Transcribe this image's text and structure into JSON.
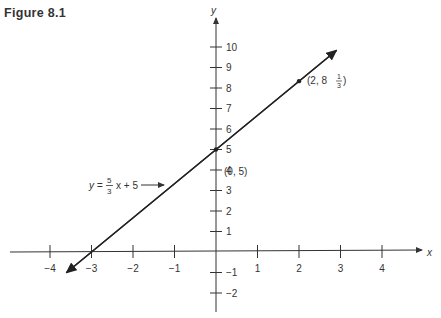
{
  "figure": {
    "title": "Figure 8.1"
  },
  "chart_data": {
    "type": "line",
    "title": "Figure 8.1",
    "xlabel": "x",
    "ylabel": "y",
    "xlim": [
      -4.5,
      4.5
    ],
    "ylim": [
      -2.5,
      10.5
    ],
    "grid": false,
    "x_ticks": [
      -4,
      -3,
      -2,
      -1,
      1,
      2,
      3,
      4
    ],
    "x_tick_labels": [
      "−4",
      "−3",
      "−2",
      "−1",
      "1",
      "2",
      "3",
      "4"
    ],
    "y_ticks": [
      -2,
      -1,
      1,
      2,
      3,
      4,
      5,
      6,
      7,
      8,
      9,
      10
    ],
    "y_tick_labels": [
      "−2",
      "−1",
      "1",
      "2",
      "3",
      "4",
      "5",
      "6",
      "7",
      "8",
      "9",
      "10"
    ],
    "series": [
      {
        "name": "y = 5/3 x + 5",
        "equation": "y = (5/3)x + 5",
        "slope": 1.6667,
        "intercept": 5,
        "x": [
          -3.6,
          -3,
          0,
          2,
          2.9
        ],
        "y": [
          -1.0,
          0,
          5,
          8.3333,
          9.8333
        ]
      }
    ],
    "points": [
      {
        "x": 0,
        "y": 5,
        "label": "(0, 5)"
      },
      {
        "x": 2,
        "y": 8.3333,
        "label": "(2, 8⅓)"
      }
    ],
    "annotations": [
      {
        "text": "y = 5/3 x + 5",
        "pointer": "arrow pointing to line"
      }
    ]
  },
  "labels": {
    "x_axis": "x",
    "y_axis": "y",
    "point_a": "(0, 5)",
    "point_b_prefix": "(2, 8",
    "point_b_num": "1",
    "point_b_den": "3",
    "point_b_suffix": ")",
    "eq_y": "y =",
    "eq_num": "5",
    "eq_den": "3",
    "eq_rest": "x + 5"
  }
}
